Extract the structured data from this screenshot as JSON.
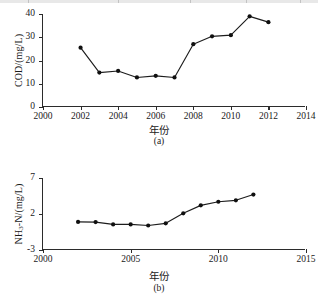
{
  "figure": {
    "xlabel_cn": "年份",
    "panel_a_caption": "(a)",
    "panel_b_caption": "(b)"
  },
  "chart_data": [
    {
      "id": "panel-a",
      "type": "line",
      "title": "",
      "panel": "(a)",
      "xlabel": "年份",
      "ylabel": "COD/(mg/L)",
      "ylabel_plain": "COD/(mg/L)",
      "xlim": [
        2000,
        2014
      ],
      "ylim": [
        0,
        40
      ],
      "xticks": [
        2000,
        2002,
        2004,
        2006,
        2008,
        2010,
        2012,
        2014
      ],
      "yticks": [
        0,
        10,
        20,
        30,
        40
      ],
      "grid": false,
      "legend": "none",
      "marker": "filled-circle",
      "x": [
        2002,
        2003,
        2004,
        2005,
        2006,
        2007,
        2008,
        2009,
        2010,
        2011,
        2012
      ],
      "values": [
        25.5,
        14.8,
        15.5,
        12.7,
        13.4,
        12.7,
        27.0,
        30.4,
        30.9,
        39.0,
        36.5
      ]
    },
    {
      "id": "panel-b",
      "type": "line",
      "title": "",
      "panel": "(b)",
      "xlabel": "年份",
      "ylabel": "NH3-N/(mg/L)",
      "ylabel_plain": "NH₃-N/(mg/L)",
      "xlim": [
        2000,
        2015
      ],
      "ylim": [
        -3,
        7
      ],
      "xticks": [
        2000,
        2005,
        2010,
        2015
      ],
      "yticks": [
        -3,
        2,
        7
      ],
      "grid": false,
      "legend": "none",
      "marker": "filled-circle",
      "x": [
        2002,
        2003,
        2004,
        2005,
        2006,
        2007,
        2008,
        2009,
        2010,
        2011,
        2012
      ],
      "values": [
        0.9,
        0.88,
        0.55,
        0.55,
        0.4,
        0.7,
        2.1,
        3.2,
        3.7,
        3.9,
        4.7
      ]
    }
  ]
}
